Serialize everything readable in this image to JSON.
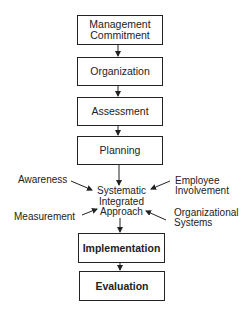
{
  "diagram": {
    "steps": [
      {
        "label": "Management\nCommitment"
      },
      {
        "label": "Organization"
      },
      {
        "label": "Assessment"
      },
      {
        "label": "Planning"
      },
      {
        "label": "Implementation"
      },
      {
        "label": "Evaluation"
      }
    ],
    "center": {
      "label": "Systematic\nIntegrated\nApproach"
    },
    "inputs": {
      "top_left": "Awareness",
      "top_right": "Employee\nInvolvement",
      "bottom_left": "Measurement",
      "bottom_right": "Organizational\nSystems"
    }
  }
}
